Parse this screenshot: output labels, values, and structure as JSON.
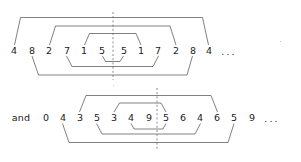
{
  "figure": {
    "background_color": "#ffffff",
    "ink_color": "#1a1a1a",
    "arc_color": "#4a4a4a",
    "mirror_color": "#5a5a5a"
  },
  "rows": [
    {
      "id": "row-top",
      "prefix": "",
      "digits": [
        "4",
        "8",
        "2",
        "7",
        "1",
        "5",
        "5",
        "1",
        "7",
        "2",
        "8",
        "4"
      ],
      "trailing": "...",
      "mirror_axis_after_index": 5,
      "pairs_above": [
        {
          "left": "4",
          "right": "4",
          "left_index": 0,
          "right_index": 11
        },
        {
          "left": "2",
          "right": "2",
          "left_index": 2,
          "right_index": 9
        },
        {
          "left": "1",
          "right": "1",
          "left_index": 4,
          "right_index": 7
        }
      ],
      "pairs_below": [
        {
          "left": "5",
          "right": "5",
          "left_index": 5,
          "right_index": 6
        },
        {
          "left": "7",
          "right": "7",
          "left_index": 3,
          "right_index": 8
        },
        {
          "left": "8",
          "right": "8",
          "left_index": 1,
          "right_index": 10
        }
      ]
    },
    {
      "id": "row-bottom",
      "prefix": "and",
      "digits": [
        "0",
        "4",
        "3",
        "5",
        "3",
        "4",
        "9",
        "5",
        "6",
        "4",
        "6",
        "5",
        "9"
      ],
      "trailing": "...",
      "mirror_axis_after_index": 6,
      "pairs_above": [
        {
          "left": "3",
          "right": "6",
          "left_index": 2,
          "right_index": 10
        },
        {
          "left": "3",
          "right": "5",
          "left_index": 4,
          "right_index": 7
        }
      ],
      "pairs_below": [
        {
          "left": "4",
          "right": "9",
          "left_index": 5,
          "right_index": 6
        },
        {
          "left": "5",
          "right": "4",
          "left_index": 3,
          "right_index": 9
        },
        {
          "left": "4",
          "right": "5",
          "left_index": 1,
          "right_index": 11
        }
      ]
    }
  ],
  "labels": {
    "and": "and",
    "ellipsis": "..."
  },
  "tokens_top": [
    {
      "text": "4",
      "x": 14,
      "y": 51
    },
    {
      "text": "8",
      "x": 32,
      "y": 51
    },
    {
      "text": "2",
      "x": 49,
      "y": 51
    },
    {
      "text": "7",
      "x": 67,
      "y": 51
    },
    {
      "text": "1",
      "x": 84,
      "y": 51
    },
    {
      "text": "5",
      "x": 102,
      "y": 51
    },
    {
      "text": "5",
      "x": 124,
      "y": 51
    },
    {
      "text": "1",
      "x": 141,
      "y": 51
    },
    {
      "text": "7",
      "x": 158,
      "y": 51
    },
    {
      "text": "2",
      "x": 176,
      "y": 51
    },
    {
      "text": "8",
      "x": 193,
      "y": 51
    },
    {
      "text": "4",
      "x": 209,
      "y": 51
    },
    {
      "text": "...",
      "x": 228,
      "y": 52
    }
  ],
  "tokens_bottom": [
    {
      "text": "and",
      "x": 21,
      "y": 118
    },
    {
      "text": "0",
      "x": 46,
      "y": 118
    },
    {
      "text": "4",
      "x": 63,
      "y": 118
    },
    {
      "text": "3",
      "x": 80,
      "y": 118
    },
    {
      "text": "5",
      "x": 97,
      "y": 118
    },
    {
      "text": "3",
      "x": 114,
      "y": 118
    },
    {
      "text": "4",
      "x": 131,
      "y": 118
    },
    {
      "text": "9",
      "x": 149,
      "y": 118
    },
    {
      "text": "5",
      "x": 166,
      "y": 118
    },
    {
      "text": "6",
      "x": 183,
      "y": 118
    },
    {
      "text": "4",
      "x": 200,
      "y": 118
    },
    {
      "text": "6",
      "x": 217,
      "y": 118
    },
    {
      "text": "5",
      "x": 234,
      "y": 118
    },
    {
      "text": "9",
      "x": 252,
      "y": 118
    },
    {
      "text": "...",
      "x": 271,
      "y": 119
    }
  ],
  "mirror_lines": [
    {
      "x": 113,
      "y1": 12,
      "y2": 80
    },
    {
      "x": 157,
      "y1": 88,
      "y2": 150
    }
  ]
}
